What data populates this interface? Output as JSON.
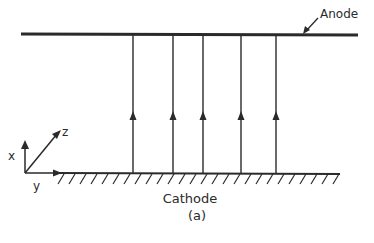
{
  "diagram": {
    "anode_label": "Anode",
    "cathode_label": "Cathode",
    "caption": "(a)",
    "axes": {
      "x": "x",
      "y": "y",
      "z": "z"
    },
    "field_lines_x": [
      133,
      173,
      203,
      241,
      276
    ],
    "colors": {
      "ink": "#2a2a2a",
      "background": "#ffffff"
    }
  }
}
